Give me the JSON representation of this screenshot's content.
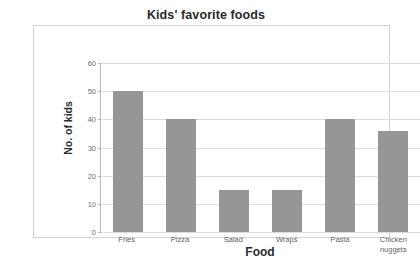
{
  "chart_data": {
    "type": "bar",
    "title": "Kids' favorite foods",
    "xlabel": "Food",
    "ylabel": "No. of kids",
    "categories": [
      "Fries",
      "Pizza",
      "Salad",
      "Wraps",
      "Pasta",
      "Chicken nuggets"
    ],
    "category_lines": [
      [
        "Fries"
      ],
      [
        "Pizza"
      ],
      [
        "Salad"
      ],
      [
        "Wraps"
      ],
      [
        "Pasta"
      ],
      [
        "Chicken",
        "nuggets"
      ]
    ],
    "values": [
      50,
      40,
      15,
      15,
      40,
      36
    ],
    "ylim": [
      0,
      60
    ],
    "yticks": [
      0,
      10,
      20,
      30,
      40,
      50,
      60
    ],
    "ytick_labels": [
      "0",
      "10",
      "20",
      "30",
      "40",
      "50",
      "60"
    ],
    "grid": true,
    "legend": null,
    "bar_color": "#969696",
    "gridline_color": "#dcdcdc",
    "axis_color": "#b9b9b9",
    "frame_color": "#d2d2d2",
    "text_color": "#2b2b2b",
    "tick_text_color": "#6f6f6f"
  }
}
